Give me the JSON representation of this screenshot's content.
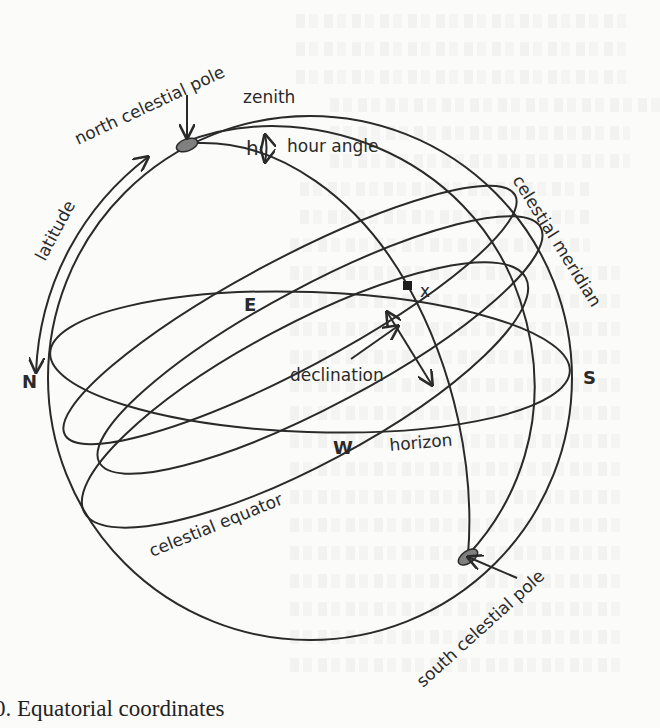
{
  "figure": {
    "caption": "0. Equatorial coordinates",
    "labels": {
      "north_celestial_pole": "north celestial pole",
      "south_celestial_pole": "south celestial pole",
      "zenith": "zenith",
      "hour_angle_symbol": "h",
      "hour_angle": "hour angle",
      "latitude": "latitude",
      "celestial_meridian": "celestial meridian",
      "star_marker": "x",
      "east": "E",
      "west": "W",
      "north": "N",
      "south": "S",
      "declination": "declination",
      "horizon": "horizon",
      "celestial_equator": "celestial equator"
    },
    "colors": {
      "line": "#2a2a2a",
      "pole_fill": "#808080",
      "paper": "#fbfbfa"
    }
  }
}
